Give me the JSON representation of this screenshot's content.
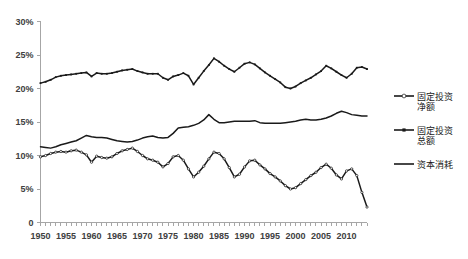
{
  "chart_data": {
    "type": "line",
    "title": "",
    "xlabel": "",
    "ylabel": "",
    "xlim": [
      1950,
      2014
    ],
    "ylim": [
      0,
      30
    ],
    "ytick_labels": [
      "0",
      "5%",
      "10%",
      "15%",
      "20%",
      "25%",
      "30%"
    ],
    "ytick_values": [
      0,
      5,
      10,
      15,
      20,
      25,
      30
    ],
    "xtick_labels": [
      "1950",
      "1955",
      "1960",
      "1965",
      "1970",
      "1975",
      "1980",
      "1985",
      "1990",
      "1995",
      "2000",
      "2005",
      "2010"
    ],
    "xtick_values": [
      1950,
      1955,
      1960,
      1965,
      1970,
      1975,
      1980,
      1985,
      1990,
      1995,
      2000,
      2005,
      2010
    ],
    "grid": false,
    "legend_position": "right",
    "x": [
      1950,
      1951,
      1952,
      1953,
      1954,
      1955,
      1956,
      1957,
      1958,
      1959,
      1960,
      1961,
      1962,
      1963,
      1964,
      1965,
      1966,
      1967,
      1968,
      1969,
      1970,
      1971,
      1972,
      1973,
      1974,
      1975,
      1976,
      1977,
      1978,
      1979,
      1980,
      1981,
      1982,
      1983,
      1984,
      1985,
      1986,
      1987,
      1988,
      1989,
      1990,
      1991,
      1992,
      1993,
      1994,
      1995,
      1996,
      1997,
      1998,
      1999,
      2000,
      2001,
      2002,
      2003,
      2004,
      2005,
      2006,
      2007,
      2008,
      2009,
      2010,
      2011,
      2012,
      2013,
      2014
    ],
    "series": [
      {
        "name": "固定投资总额",
        "legend_key": "gross-fixed-investment",
        "marker": "square",
        "color": "#1a1a1a",
        "values": [
          20.8,
          21.0,
          21.3,
          21.7,
          21.9,
          22.0,
          22.1,
          22.2,
          22.3,
          22.4,
          21.8,
          22.3,
          22.2,
          22.2,
          22.3,
          22.5,
          22.7,
          22.8,
          22.9,
          22.6,
          22.4,
          22.2,
          22.2,
          22.2,
          21.6,
          21.3,
          21.8,
          22.0,
          22.3,
          21.9,
          20.6,
          21.6,
          22.6,
          23.5,
          24.5,
          24.0,
          23.4,
          22.9,
          22.5,
          23.1,
          23.7,
          23.9,
          23.6,
          23.0,
          22.4,
          21.9,
          21.4,
          20.9,
          20.2,
          20.0,
          20.3,
          20.8,
          21.2,
          21.6,
          22.1,
          22.6,
          23.4,
          23.0,
          22.5,
          22.0,
          21.6,
          22.2,
          23.1,
          23.2,
          22.9
        ]
      },
      {
        "name": "资本消耗",
        "legend_key": "capital-consumption",
        "marker": "none",
        "color": "#1a1a1a",
        "values": [
          11.3,
          11.2,
          11.1,
          11.3,
          11.6,
          11.8,
          12.0,
          12.2,
          12.6,
          13.0,
          12.8,
          12.7,
          12.7,
          12.6,
          12.4,
          12.2,
          12.1,
          12.0,
          12.1,
          12.3,
          12.6,
          12.8,
          12.9,
          12.7,
          12.6,
          12.7,
          13.3,
          14.1,
          14.2,
          14.3,
          14.5,
          14.8,
          15.3,
          16.1,
          15.4,
          14.9,
          14.9,
          15.0,
          15.1,
          15.1,
          15.1,
          15.1,
          15.2,
          14.9,
          14.8,
          14.8,
          14.8,
          14.8,
          14.9,
          15.0,
          15.1,
          15.3,
          15.4,
          15.3,
          15.3,
          15.4,
          15.6,
          15.9,
          16.3,
          16.6,
          16.4,
          16.1,
          16.0,
          15.9,
          15.9
        ]
      },
      {
        "name": "固定投资净额",
        "legend_key": "net-fixed-investment",
        "marker": "circle-open",
        "color": "#1a1a1a",
        "values": [
          9.8,
          10.0,
          10.3,
          10.5,
          10.6,
          10.5,
          10.7,
          10.8,
          10.5,
          10.1,
          9.0,
          9.9,
          9.7,
          9.6,
          9.8,
          10.3,
          10.7,
          10.9,
          11.1,
          10.6,
          10.0,
          9.5,
          9.3,
          9.0,
          8.3,
          8.8,
          9.8,
          10.0,
          9.3,
          8.0,
          6.8,
          7.5,
          8.4,
          9.5,
          10.5,
          10.3,
          9.5,
          8.2,
          6.8,
          7.2,
          8.3,
          9.2,
          9.3,
          8.6,
          8.0,
          7.3,
          6.8,
          6.2,
          5.5,
          5.0,
          5.2,
          5.8,
          6.4,
          7.0,
          7.5,
          8.2,
          8.7,
          8.1,
          7.1,
          6.5,
          7.7,
          8.0,
          7.0,
          4.5,
          2.3
        ]
      }
    ]
  },
  "legend": {
    "items": [
      {
        "label_line1": "固定投资",
        "label_line2": "净额",
        "marker": "circle-open"
      },
      {
        "label_line1": "固定投资",
        "label_line2": "总额",
        "marker": "square"
      },
      {
        "label_line1": "资本消耗",
        "label_line2": "",
        "marker": "line"
      }
    ]
  },
  "colors": {
    "series_stroke": "#1a1a1a",
    "axis": "#a6a6a6",
    "tick_text": "#404040",
    "background": "#ffffff"
  }
}
